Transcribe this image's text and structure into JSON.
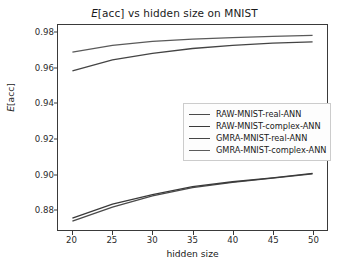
{
  "chart_data": {
    "type": "line",
    "title": "E[acc] vs hidden size on MNIST",
    "title_prefix": "E",
    "title_rest": "[acc] vs hidden size on MNIST",
    "xlabel": "hidden size",
    "ylabel": "E[acc]",
    "ylabel_prefix": "E",
    "ylabel_rest": "[acc]",
    "x": [
      20,
      25,
      30,
      35,
      40,
      45,
      50
    ],
    "xlim": [
      18.2,
      51.8
    ],
    "ylim": [
      0.8685,
      0.9845
    ],
    "xticks": [
      20,
      25,
      30,
      35,
      40,
      45,
      50
    ],
    "xtick_labels": [
      "20",
      "25",
      "30",
      "35",
      "40",
      "45",
      "50"
    ],
    "yticks": [
      0.88,
      0.9,
      0.92,
      0.94,
      0.96,
      0.98
    ],
    "ytick_labels": [
      "0.88",
      "0.90",
      "0.92",
      "0.94",
      "0.96",
      "0.98"
    ],
    "grid": false,
    "legend_position": "center right",
    "series": [
      {
        "name": "RAW-MNIST-real-ANN",
        "color": "#4a4a4a",
        "values": [
          0.8735,
          0.8815,
          0.8878,
          0.8925,
          0.8955,
          0.8978,
          0.9002
        ]
      },
      {
        "name": "RAW-MNIST-complex-ANN",
        "color": "#3a3a3a",
        "values": [
          0.8752,
          0.8832,
          0.8885,
          0.893,
          0.8958,
          0.898,
          0.9005
        ]
      },
      {
        "name": "GMRA-MNIST-real-ANN",
        "color": "#444444",
        "values": [
          0.9585,
          0.9648,
          0.9685,
          0.9712,
          0.973,
          0.9742,
          0.975
        ]
      },
      {
        "name": "GMRA-MNIST-complex-ANN",
        "color": "#5a5a5a",
        "values": [
          0.9692,
          0.973,
          0.9752,
          0.9765,
          0.9774,
          0.9781,
          0.9786
        ]
      }
    ]
  }
}
